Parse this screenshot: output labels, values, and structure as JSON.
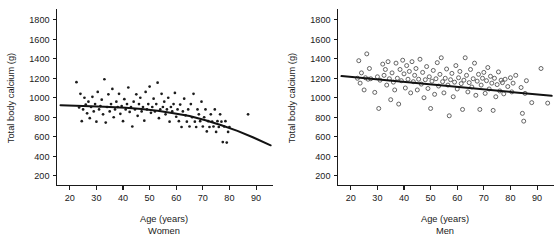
{
  "figure": {
    "background": "#ffffff",
    "ink_color": "#1a1a1a",
    "panel_count": 2
  },
  "chart_data": [
    {
      "type": "scatter",
      "panel_id": "women",
      "title": "",
      "subtitle": "Women",
      "xlabel": "Age (years)",
      "ylabel": "Total body calcium (g)",
      "xlim": [
        15,
        96
      ],
      "ylim": [
        100,
        1900
      ],
      "xticks": [
        20,
        30,
        40,
        50,
        60,
        70,
        80,
        90
      ],
      "xticklabels": [
        "20",
        "30",
        "40",
        "50",
        "60",
        "70",
        "80",
        "90"
      ],
      "yticks": [
        200,
        400,
        600,
        800,
        1000,
        1200,
        1400,
        1600,
        1800
      ],
      "yticklabels": [
        "200",
        "400",
        "600",
        "800",
        "1000",
        "1200",
        "1400",
        "1600",
        "1800"
      ],
      "grid": false,
      "legend": false,
      "marker": "filled-dot",
      "marker_size": 1.35,
      "marker_color": "#1c1c1c",
      "n_points": 268,
      "fit": {
        "kind": "curve",
        "label": "regression curve",
        "color": "#121212",
        "width": 2.0,
        "points": [
          [
            16.5,
            922
          ],
          [
            25,
            915
          ],
          [
            33,
            907
          ],
          [
            41,
            898
          ],
          [
            47,
            885
          ],
          [
            53,
            866
          ],
          [
            59,
            842
          ],
          [
            65,
            812
          ],
          [
            71,
            769
          ],
          [
            77,
            718
          ],
          [
            83,
            660
          ],
          [
            89,
            592
          ],
          [
            95.5,
            512
          ]
        ]
      },
      "points": [
        [
          22.5,
          1160
        ],
        [
          23.5,
          900
        ],
        [
          24,
          1040
        ],
        [
          24.5,
          760
        ],
        [
          25,
          880
        ],
        [
          25.5,
          1000
        ],
        [
          26,
          930
        ],
        [
          26.5,
          840
        ],
        [
          27,
          960
        ],
        [
          27.5,
          790
        ],
        [
          28,
          905
        ],
        [
          28.5,
          1010
        ],
        [
          29,
          860
        ],
        [
          29.5,
          935
        ],
        [
          30,
          755
        ],
        [
          30.5,
          1060
        ],
        [
          31,
          880
        ],
        [
          31.5,
          915
        ],
        [
          32,
          980
        ],
        [
          32.5,
          830
        ],
        [
          33,
          1190
        ],
        [
          33.5,
          745
        ],
        [
          34,
          905
        ],
        [
          34.5,
          1035
        ],
        [
          35,
          860
        ],
        [
          35.5,
          935
        ],
        [
          36,
          1090
        ],
        [
          36.5,
          800
        ],
        [
          37,
          880
        ],
        [
          37.5,
          960
        ],
        [
          38,
          905
        ],
        [
          38.5,
          1040
        ],
        [
          39,
          835
        ],
        [
          39.5,
          915
        ],
        [
          40,
          760
        ],
        [
          40.5,
          985
        ],
        [
          41,
          880
        ],
        [
          41.5,
          935
        ],
        [
          42,
          1105
        ],
        [
          42.5,
          855
        ],
        [
          43,
          905
        ],
        [
          43.5,
          705
        ],
        [
          44,
          960
        ],
        [
          44.5,
          880
        ],
        [
          45,
          1035
        ],
        [
          45.5,
          815
        ],
        [
          46,
          935
        ],
        [
          46.5,
          1000
        ],
        [
          47,
          860
        ],
        [
          47.5,
          905
        ],
        [
          48,
          765
        ],
        [
          48.5,
          1060
        ],
        [
          49,
          880
        ],
        [
          49.5,
          935
        ],
        [
          50,
          1115
        ],
        [
          50.5,
          845
        ],
        [
          51,
          905
        ],
        [
          51.5,
          990
        ],
        [
          52,
          860
        ],
        [
          52.5,
          935
        ],
        [
          53,
          1155
        ],
        [
          53.5,
          790
        ],
        [
          54,
          880
        ],
        [
          54.5,
          1040
        ],
        [
          55,
          905
        ],
        [
          55.5,
          960
        ],
        [
          56,
          830
        ],
        [
          56.5,
          880
        ],
        [
          57,
          1000
        ],
        [
          57.5,
          755
        ],
        [
          58,
          905
        ],
        [
          58.5,
          860
        ],
        [
          59,
          935
        ],
        [
          59.5,
          1050
        ],
        [
          60,
          805
        ],
        [
          60.5,
          880
        ],
        [
          61,
          760
        ],
        [
          61.5,
          930
        ],
        [
          62,
          700
        ],
        [
          62.5,
          860
        ],
        [
          63,
          990
        ],
        [
          63.5,
          820
        ],
        [
          64,
          755
        ],
        [
          64.5,
          880
        ],
        [
          65,
          705
        ],
        [
          65.5,
          935
        ],
        [
          66,
          800
        ],
        [
          66.5,
          1040
        ],
        [
          67,
          755
        ],
        [
          67.5,
          700
        ],
        [
          68,
          880
        ],
        [
          68.5,
          830
        ],
        [
          69,
          760
        ],
        [
          69.5,
          960
        ],
        [
          70,
          705
        ],
        [
          70.5,
          800
        ],
        [
          71,
          880
        ],
        [
          71.5,
          655
        ],
        [
          72,
          760
        ],
        [
          72.5,
          700
        ],
        [
          73,
          830
        ],
        [
          73.5,
          755
        ],
        [
          74,
          705
        ],
        [
          74.5,
          880
        ],
        [
          75,
          650
        ],
        [
          75.5,
          760
        ],
        [
          76,
          700
        ],
        [
          76.5,
          830
        ],
        [
          77,
          755
        ],
        [
          77.5,
          545
        ],
        [
          78,
          705
        ],
        [
          78.5,
          760
        ],
        [
          79,
          540
        ],
        [
          79.5,
          650
        ],
        [
          80,
          700
        ],
        [
          87,
          830
        ]
      ],
      "bands": {
        "note": "values quantised into horizontal rows of 50 g",
        "row_spacing": 50
      }
    },
    {
      "type": "scatter",
      "panel_id": "men",
      "title": "",
      "subtitle": "Men",
      "xlabel": "Age (years)",
      "ylabel": "Total body calcium (g)",
      "xlim": [
        15,
        96
      ],
      "ylim": [
        100,
        1900
      ],
      "xticks": [
        20,
        30,
        40,
        50,
        60,
        70,
        80,
        90
      ],
      "xticklabels": [
        "20",
        "30",
        "40",
        "50",
        "60",
        "70",
        "80",
        "90"
      ],
      "yticks": [
        200,
        400,
        600,
        800,
        1000,
        1200,
        1400,
        1600,
        1800
      ],
      "yticklabels": [
        "200",
        "400",
        "600",
        "800",
        "1000",
        "1200",
        "1400",
        "1600",
        "1800"
      ],
      "grid": false,
      "legend": false,
      "marker": "open-circle",
      "marker_size": 2.0,
      "marker_color": "#4a4a4a",
      "n_points": 142,
      "fit": {
        "kind": "line",
        "label": "regression line",
        "color": "#121212",
        "width": 2.0,
        "points": [
          [
            16.5,
            1222
          ],
          [
            95.5,
            1020
          ]
        ]
      },
      "points": [
        [
          22.5,
          1200
        ],
        [
          23,
          1380
        ],
        [
          23.5,
          1150
        ],
        [
          24,
          1255
        ],
        [
          25,
          1080
        ],
        [
          25.5,
          1205
        ],
        [
          26,
          1450
        ],
        [
          26.5,
          1190
        ],
        [
          27,
          1300
        ],
        [
          27.5,
          1195
        ],
        [
          29,
          1055
        ],
        [
          30,
          1215
        ],
        [
          30.5,
          890
        ],
        [
          31,
          1180
        ],
        [
          32,
          1345
        ],
        [
          32.5,
          1230
        ],
        [
          33,
          1290
        ],
        [
          33.5,
          1130
        ],
        [
          34,
          1370
        ],
        [
          34.5,
          1195
        ],
        [
          35,
          980
        ],
        [
          35.5,
          1255
        ],
        [
          36,
          1160
        ],
        [
          36.5,
          1080
        ],
        [
          37,
          1355
        ],
        [
          37.5,
          1200
        ],
        [
          38,
          935
        ],
        [
          38.5,
          1290
        ],
        [
          39,
          1175
        ],
        [
          39.5,
          1385
        ],
        [
          40,
          1245
        ],
        [
          40.5,
          1100
        ],
        [
          41,
          1330
        ],
        [
          41.5,
          1190
        ],
        [
          42,
          1270
        ],
        [
          42.5,
          1050
        ],
        [
          43,
          1370
        ],
        [
          43.5,
          1165
        ],
        [
          44,
          1230
        ],
        [
          44.5,
          1300
        ],
        [
          45,
          1080
        ],
        [
          45.5,
          1190
        ],
        [
          46,
          1395
        ],
        [
          46.5,
          1140
        ],
        [
          47,
          1260
        ],
        [
          47.5,
          1000
        ],
        [
          48,
          1185
        ],
        [
          48.5,
          1320
        ],
        [
          49,
          1095
        ],
        [
          49.5,
          1215
        ],
        [
          50,
          890
        ],
        [
          50.5,
          1170
        ],
        [
          51,
          1280
        ],
        [
          51.5,
          1035
        ],
        [
          52,
          1195
        ],
        [
          52.5,
          1360
        ],
        [
          53,
          1120
        ],
        [
          53.5,
          1240
        ],
        [
          54,
          1410
        ],
        [
          54.5,
          1165
        ],
        [
          55,
          1050
        ],
        [
          55.5,
          1200
        ],
        [
          56,
          1295
        ],
        [
          56.5,
          1130
        ],
        [
          57,
          815
        ],
        [
          57.5,
          1185
        ],
        [
          58,
          1250
        ],
        [
          58.5,
          1010
        ],
        [
          59,
          1160
        ],
        [
          59.5,
          1330
        ],
        [
          60,
          1090
        ],
        [
          60.5,
          1205
        ],
        [
          61,
          1270
        ],
        [
          61.5,
          1145
        ],
        [
          62,
          880
        ],
        [
          62.5,
          1180
        ],
        [
          63,
          1410
        ],
        [
          63.5,
          1230
        ],
        [
          64,
          1060
        ],
        [
          64.5,
          1155
        ],
        [
          65,
          1290
        ],
        [
          65.5,
          1110
        ],
        [
          66,
          1195
        ],
        [
          66.5,
          1355
        ],
        [
          67,
          1025
        ],
        [
          67.5,
          1170
        ],
        [
          68,
          1240
        ],
        [
          68.5,
          880
        ],
        [
          69,
          1130
        ],
        [
          69.5,
          1200
        ],
        [
          70,
          1260
        ],
        [
          70.5,
          1045
        ],
        [
          71,
          1175
        ],
        [
          71.5,
          1310
        ],
        [
          72,
          1090
        ],
        [
          72.5,
          1220
        ],
        [
          73,
          1150
        ],
        [
          73.5,
          870
        ],
        [
          74,
          1200
        ],
        [
          74.5,
          1010
        ],
        [
          75,
          1135
        ],
        [
          75.5,
          1265
        ],
        [
          76,
          1070
        ],
        [
          76.5,
          1180
        ],
        [
          77,
          1155
        ],
        [
          77.5,
          1040
        ],
        [
          78,
          1190
        ],
        [
          79,
          1115
        ],
        [
          80,
          1205
        ],
        [
          80.5,
          1060
        ],
        [
          81,
          1150
        ],
        [
          82,
          1230
        ],
        [
          84,
          1105
        ],
        [
          84.5,
          840
        ],
        [
          85,
          760
        ],
        [
          85.5,
          1045
        ],
        [
          86,
          1175
        ],
        [
          88,
          950
        ],
        [
          91.5,
          1300
        ],
        [
          94,
          945
        ]
      ]
    }
  ]
}
